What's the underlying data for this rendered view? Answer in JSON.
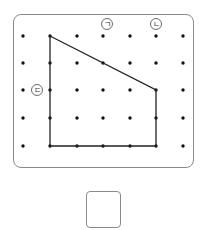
{
  "diagram": {
    "grid": {
      "columns_x": [
        23,
        50,
        77,
        103,
        130,
        156,
        183
      ],
      "rows_y": [
        36,
        63,
        90,
        118,
        146
      ],
      "dot_color": "#111111"
    },
    "polygon": {
      "points": "50,36 156,90 156,146 50,146",
      "stroke": "#222222"
    },
    "labels": [
      {
        "id": "label-giyeok",
        "text": "ㄱ",
        "x": 107,
        "y": 24
      },
      {
        "id": "label-nieun",
        "text": "ㄴ",
        "x": 156,
        "y": 24
      },
      {
        "id": "label-digeut",
        "text": "ㄷ",
        "x": 37,
        "y": 90
      }
    ]
  },
  "answer": {
    "value": ""
  }
}
